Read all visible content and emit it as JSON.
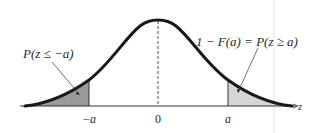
{
  "diagram": {
    "type": "standard-normal-distribution",
    "left_tail_label": "P(z ≤ −a)",
    "right_tail_label": "1 − F(a) = P(z ≥ a)",
    "axis_label": "z",
    "ticks": [
      {
        "label": "−a"
      },
      {
        "label": "0"
      },
      {
        "label": "a"
      }
    ],
    "colors": {
      "curve": "#1a1a1a",
      "left_tail_fill": "#9a9a9a",
      "right_tail_fill": "#d6d6d6",
      "axis": "#333333"
    }
  }
}
